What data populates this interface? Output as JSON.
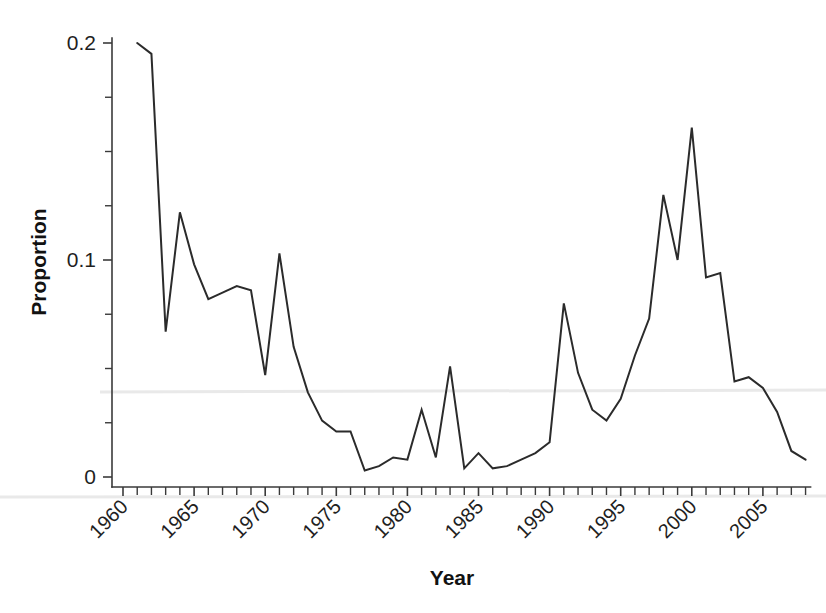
{
  "chart_data": {
    "type": "line",
    "title": "",
    "subtitle": "",
    "xlabel": "Year",
    "ylabel": "Proportion",
    "xlim": [
      1960,
      2008
    ],
    "ylim": [
      0,
      0.205
    ],
    "grid": false,
    "legend": null,
    "x_tick_labels": [
      "1960",
      "1965",
      "1970",
      "1975",
      "1980",
      "1985",
      "1990",
      "1995",
      "2000",
      "2005"
    ],
    "x_tick_values": [
      1960,
      1965,
      1970,
      1975,
      1980,
      1985,
      1990,
      1995,
      2000,
      2005
    ],
    "x_minor_tick_step": 1,
    "y_tick_labels": [
      "0",
      "0.1",
      "0.2"
    ],
    "y_tick_values": [
      0,
      0.1,
      0.2
    ],
    "y_minor_tick_step": 0.025,
    "series_name": "Proportion",
    "line_color": "#2b2b2b",
    "x": [
      1961,
      1962,
      1963,
      1964,
      1965,
      1966,
      1967,
      1968,
      1969,
      1970,
      1971,
      1972,
      1973,
      1974,
      1975,
      1976,
      1977,
      1978,
      1979,
      1980,
      1981,
      1982,
      1983,
      1984,
      1985,
      1986,
      1987,
      1988,
      1989,
      1990,
      1991,
      1992,
      1993,
      1994,
      1995,
      1996,
      1997,
      1998,
      1999,
      2000,
      2001,
      2002,
      2003,
      2004,
      2005,
      2006,
      2007,
      2008
    ],
    "values": [
      0.2,
      0.195,
      0.067,
      0.122,
      0.098,
      0.082,
      0.085,
      0.088,
      0.086,
      0.047,
      0.103,
      0.06,
      0.039,
      0.026,
      0.021,
      0.021,
      0.003,
      0.005,
      0.009,
      0.008,
      0.031,
      0.009,
      0.051,
      0.004,
      0.011,
      0.004,
      0.005,
      0.008,
      0.011,
      0.016,
      0.08,
      0.048,
      0.031,
      0.026,
      0.036,
      0.056,
      0.073,
      0.13,
      0.1,
      0.161,
      0.092,
      0.094,
      0.044,
      0.046,
      0.041,
      0.03,
      0.012,
      0.008
    ]
  },
  "axes": {
    "ylabel": "Proportion",
    "xlabel": "Year"
  }
}
